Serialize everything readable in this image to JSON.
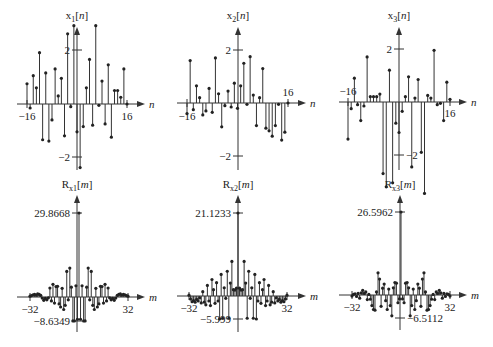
{
  "figure": {
    "background": "#ffffff",
    "stroke_color": "#333333"
  },
  "chart_data": [
    {
      "id": "x1",
      "type": "stem",
      "title": "x1[n]",
      "title_main": "x",
      "title_sub": "1",
      "title_arg": "[n]",
      "xlabel": "n",
      "xlim": [
        -16,
        16
      ],
      "ylim": [
        -2,
        2
      ],
      "xticks": [
        -16,
        16
      ],
      "xtick_labels": [
        "−16",
        "16"
      ],
      "yticks": [
        2,
        -2
      ],
      "ytick_labels": [
        "2",
        "−2"
      ],
      "x": [
        -16,
        -15,
        -14,
        -13,
        -12,
        -11,
        -10,
        -9,
        -8,
        -7,
        -6,
        -5,
        -4,
        -3,
        -2,
        -1,
        0,
        1,
        2,
        3,
        4,
        5,
        6,
        7,
        8,
        9,
        10,
        11,
        12,
        13,
        14,
        15,
        16
      ],
      "values": [
        0.75,
        -0.15,
        1.05,
        0.6,
        1.9,
        -1.35,
        1.15,
        -1.4,
        -0.6,
        1.3,
        0.3,
        0.95,
        -1.2,
        2.6,
        -0.1,
        2.9,
        -1.05,
        -2.4,
        -0.85,
        0.6,
        1.65,
        -0.8,
        2.9,
        -0.05,
        0.85,
        -0.75,
        1.45,
        -1.25,
        0.5,
        0.5,
        0.25,
        1.3,
        0
      ]
    },
    {
      "id": "x2",
      "type": "stem",
      "title": "x2[n]",
      "title_main": "x",
      "title_sub": "2",
      "title_arg": "[n]",
      "xlabel": "n",
      "xlim": [
        -16,
        16
      ],
      "ylim": [
        -2,
        2
      ],
      "xticks": [
        -16,
        16
      ],
      "xtick_labels": [
        "−16",
        "16"
      ],
      "yticks": [
        2,
        -2
      ],
      "ytick_labels": [
        "2",
        "−2"
      ],
      "x": [
        -16,
        -15,
        -14,
        -13,
        -12,
        -11,
        -10,
        -9,
        -8,
        -7,
        -6,
        -5,
        -4,
        -3,
        -2,
        -1,
        0,
        1,
        2,
        3,
        4,
        5,
        6,
        7,
        8,
        9,
        10,
        11,
        12,
        13,
        14,
        15,
        16
      ],
      "values": [
        -0.4,
        1.6,
        -0.25,
        0.65,
        0.2,
        -0.45,
        -0.3,
        0.55,
        -0.35,
        1.7,
        0.35,
        -0.9,
        -0.1,
        0.45,
        -0.15,
        0.75,
        -0.2,
        0.65,
        1.5,
        -0.05,
        1.75,
        0.3,
        -0.85,
        0.2,
        1.3,
        -0.95,
        -1.05,
        -1.25,
        -0.85,
        -0.05,
        -1.4,
        -1.1,
        0
      ]
    },
    {
      "id": "x3",
      "type": "stem",
      "title": "x3[n]",
      "title_main": "x",
      "title_sub": "3",
      "title_arg": "[n]",
      "xlabel": "n",
      "xlim": [
        -16,
        16
      ],
      "ylim": [
        -2,
        2
      ],
      "xticks": [
        -16,
        16
      ],
      "xtick_labels": [
        "−16",
        "16"
      ],
      "yticks": [
        2,
        -2
      ],
      "ytick_labels": [
        "2",
        "−2"
      ],
      "x": [
        -16,
        -15,
        -14,
        -13,
        -12,
        -11,
        -10,
        -9,
        -8,
        -7,
        -6,
        -5,
        -4,
        -3,
        -2,
        -1,
        0,
        1,
        2,
        3,
        4,
        5,
        6,
        7,
        8,
        9,
        10,
        11,
        12,
        13,
        14,
        15,
        16
      ],
      "values": [
        -1.4,
        -0.25,
        0.9,
        -0.1,
        -0.7,
        -0.15,
        1.7,
        0.2,
        0.2,
        0.2,
        0.3,
        -2.7,
        -3.2,
        1.2,
        -3.05,
        -0.8,
        -1.15,
        -0.35,
        0.2,
        0.95,
        -2.45,
        0.15,
        0.85,
        -1.9,
        -3.45,
        0.25,
        0.15,
        1.95,
        -0.1,
        -0.05,
        -0.7,
        0.75,
        0.1
      ]
    },
    {
      "id": "Rx1",
      "type": "stem",
      "title": "Rx1[m]",
      "title_main": "R",
      "title_sub": "x1",
      "title_arg": "[m]",
      "xlabel": "m",
      "xlim": [
        -32,
        32
      ],
      "ylim": [
        -8.6349,
        29.8668
      ],
      "xticks": [
        -32,
        32
      ],
      "xtick_labels": [
        "−32",
        "32"
      ],
      "yticks": [
        29.8668,
        -8.6349
      ],
      "ytick_labels": [
        "29.8668",
        "−8.6349"
      ],
      "x": [
        -32,
        -31,
        -30,
        -29,
        -28,
        -27,
        -26,
        -25,
        -24,
        -23,
        -22,
        -21,
        -20,
        -19,
        -18,
        -17,
        -16,
        -15,
        -14,
        -13,
        -12,
        -11,
        -10,
        -9,
        -8,
        -7,
        -6,
        -5,
        -4,
        -3,
        -2,
        -1,
        0,
        1,
        2,
        3,
        4,
        5,
        6,
        7,
        8,
        9,
        10,
        11,
        12,
        13,
        14,
        15,
        16,
        17,
        18,
        19,
        20,
        21,
        22,
        23,
        24,
        25,
        26,
        27,
        28,
        29,
        30,
        31,
        32
      ],
      "values": [
        0.3,
        0.5,
        0.8,
        0.9,
        0.7,
        1.1,
        0.9,
        0.6,
        -0.4,
        -1.2,
        -0.5,
        -1.0,
        -0.3,
        3.2,
        -1.4,
        4.5,
        -2.2,
        3.7,
        3.8,
        -2.5,
        -3.6,
        3.1,
        -4.5,
        -3.0,
        9.1,
        -1.0,
        10.3,
        3.5,
        -8.6,
        -8.63,
        4.0,
        -8.0,
        29.8668,
        -8.0,
        4.0,
        -8.63,
        -8.6,
        3.5,
        10.3,
        -1.0,
        9.1,
        -3.0,
        -4.5,
        3.1,
        -3.6,
        -2.5,
        3.8,
        3.7,
        -2.2,
        4.5,
        -1.4,
        3.2,
        -0.3,
        -1.0,
        -0.5,
        -1.2,
        -0.4,
        0.6,
        0.9,
        1.1,
        0.7,
        0.9,
        0.8,
        0.5,
        0.3
      ]
    },
    {
      "id": "Rx2",
      "type": "stem",
      "title": "Rx2[m]",
      "title_main": "R",
      "title_sub": "x2",
      "title_arg": "[m]",
      "xlabel": "m",
      "xlim": [
        -32,
        32
      ],
      "ylim": [
        -5.999,
        21.1233
      ],
      "xticks": [
        -32,
        32
      ],
      "xtick_labels": [
        "−32",
        "32"
      ],
      "yticks": [
        21.1233,
        -5.999
      ],
      "ytick_labels": [
        "21.1233",
        "−5.999"
      ],
      "x": [
        -32,
        -31,
        -30,
        -29,
        -28,
        -27,
        -26,
        -25,
        -24,
        -23,
        -22,
        -21,
        -20,
        -19,
        -18,
        -17,
        -16,
        -15,
        -14,
        -13,
        -12,
        -11,
        -10,
        -9,
        -8,
        -7,
        -6,
        -5,
        -4,
        -3,
        -2,
        -1,
        0,
        1,
        2,
        3,
        4,
        5,
        6,
        7,
        8,
        9,
        10,
        11,
        12,
        13,
        14,
        15,
        16,
        17,
        18,
        19,
        20,
        21,
        22,
        23,
        24,
        25,
        26,
        27,
        28,
        29,
        30,
        31,
        32
      ],
      "values": [
        0.2,
        -0.8,
        -1.5,
        -1.2,
        -1.6,
        -0.9,
        -1.3,
        -0.5,
        -1.8,
        1.1,
        -1.6,
        -2.3,
        2.7,
        -1.3,
        -2.5,
        4.2,
        1.6,
        -1.9,
        3.4,
        -1.3,
        -6.0,
        5.5,
        -5.8,
        2.1,
        -0.6,
        6.3,
        -5.8,
        3.3,
        8.8,
        1.6,
        1.5,
        2.0,
        21.1233,
        2.0,
        1.5,
        1.6,
        8.8,
        3.3,
        -5.8,
        6.3,
        -0.6,
        2.1,
        -5.8,
        5.5,
        -6.0,
        -1.3,
        3.4,
        -1.9,
        1.6,
        4.2,
        -2.5,
        -1.3,
        2.7,
        -2.3,
        -1.6,
        1.1,
        -1.8,
        -0.5,
        -1.3,
        -0.9,
        -1.6,
        -1.2,
        -1.5,
        -0.8,
        0.2
      ]
    },
    {
      "id": "Rx3",
      "type": "stem",
      "title": "Rx3[m]",
      "title_main": "R",
      "title_sub": "x3",
      "title_arg": "[m]",
      "xlabel": "m",
      "xlim": [
        -32,
        32
      ],
      "ylim": [
        -6.5112,
        26.5962
      ],
      "xticks": [
        -32,
        32
      ],
      "xtick_labels": [
        "−32",
        "32"
      ],
      "yticks": [
        26.5962,
        -6.5112
      ],
      "ytick_labels": [
        "26.5962",
        "−6.5112"
      ],
      "x": [
        -32,
        -31,
        -30,
        -29,
        -28,
        -27,
        -26,
        -25,
        -24,
        -23,
        -22,
        -21,
        -20,
        -19,
        -18,
        -17,
        -16,
        -15,
        -14,
        -13,
        -12,
        -11,
        -10,
        -9,
        -8,
        -7,
        -6,
        -5,
        -4,
        -3,
        -2,
        -1,
        0,
        1,
        2,
        3,
        4,
        5,
        6,
        7,
        8,
        9,
        10,
        11,
        12,
        13,
        14,
        15,
        16,
        17,
        18,
        19,
        20,
        21,
        22,
        23,
        24,
        25,
        26,
        27,
        28,
        29,
        30,
        31,
        32
      ],
      "values": [
        -0.3,
        0.2,
        0.4,
        -0.4,
        0.5,
        -0.9,
        0.7,
        1.5,
        0.5,
        1.0,
        -1.3,
        0.2,
        -1.2,
        -3.0,
        -4.1,
        -4.3,
        1.0,
        7.1,
        5.1,
        -3.2,
        2.2,
        3.5,
        -1.6,
        -4.1,
        1.9,
        -3.0,
        -5.9,
        2.3,
        4.0,
        3.8,
        -2.2,
        -1.1,
        26.5962,
        -1.1,
        -2.2,
        3.8,
        4.0,
        2.3,
        -5.9,
        -3.0,
        1.9,
        -4.1,
        -1.6,
        3.5,
        2.2,
        -3.2,
        5.1,
        7.1,
        1.0,
        -4.3,
        -4.1,
        -3.0,
        -1.2,
        0.2,
        -1.3,
        1.0,
        0.5,
        1.5,
        0.7,
        -0.9,
        0.5,
        -0.4,
        0.4,
        0.2,
        -0.3
      ]
    }
  ],
  "panels": [
    {
      "axis_x": 77,
      "baseline_y": 104,
      "x_left": 27,
      "x_right": 127,
      "ytop_y": 50,
      "ybot_y": 157,
      "axis_top": 27,
      "axis_bottom": 170,
      "h_left": 17,
      "h_right": 145,
      "title_x": 77,
      "title_y": 19,
      "ylabel_side": "left",
      "xtick_label_y": 120,
      "xtick_right_above": false,
      "xtick_left_above": false
    },
    {
      "axis_x": 238,
      "baseline_y": 103,
      "x_left": 187,
      "x_right": 288,
      "ytop_y": 50,
      "ybot_y": 156,
      "axis_top": 27,
      "axis_bottom": 170,
      "h_left": 177,
      "h_right": 306,
      "title_x": 238,
      "title_y": 19,
      "ylabel_side": "left",
      "xtick_label_y": 120,
      "xtick_right_above": true,
      "xtick_left_above": false
    },
    {
      "axis_x": 399,
      "baseline_y": 102,
      "x_left": 348,
      "x_right": 450,
      "ytop_y": 49,
      "ybot_y": 155,
      "axis_top": 27,
      "axis_bottom": 170,
      "h_left": 339,
      "h_right": 467,
      "title_x": 399,
      "title_y": 19,
      "ylabel_side": "mixed",
      "xtick_label_y": 117,
      "xtick_right_above": false,
      "xtick_left_above": true
    },
    {
      "axis_x": 77,
      "baseline_y": 297,
      "x_left": 30,
      "x_right": 128,
      "ytop_y": 213,
      "ybot_y": 321,
      "axis_top": 195,
      "axis_bottom": 332,
      "h_left": 17,
      "h_right": 145,
      "title_x": 77,
      "title_y": 188,
      "ylabel_side": "left",
      "xtick_label_y": 313,
      "xtick_right_above": false,
      "xtick_left_above": false
    },
    {
      "axis_x": 238,
      "baseline_y": 296,
      "x_left": 189,
      "x_right": 287,
      "ytop_y": 213,
      "ybot_y": 319,
      "axis_top": 195,
      "axis_bottom": 332,
      "h_left": 177,
      "h_right": 306,
      "title_x": 238,
      "title_y": 188,
      "ylabel_side": "left",
      "xtick_label_y": 312,
      "xtick_right_above": false,
      "xtick_left_above": false
    },
    {
      "axis_x": 400,
      "baseline_y": 295,
      "x_left": 352,
      "x_right": 450,
      "ytop_y": 212,
      "ybot_y": 318,
      "axis_top": 195,
      "axis_bottom": 330,
      "h_left": 339,
      "h_right": 467,
      "title_x": 400,
      "title_y": 188,
      "ylabel_side": "mixed",
      "xtick_label_y": 311,
      "xtick_right_above": false,
      "xtick_left_above": false
    }
  ]
}
